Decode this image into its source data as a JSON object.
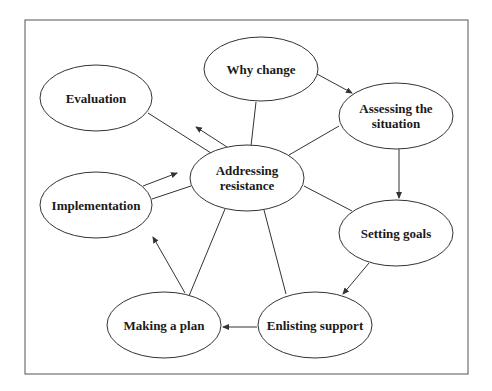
{
  "diagram": {
    "type": "cycle-with-hub",
    "frame": {
      "x": 25,
      "y": 20,
      "width": 443,
      "height": 354,
      "stroke": "#555555"
    },
    "hub": {
      "id": "hub",
      "lines": [
        "Addressing",
        "resistance"
      ],
      "cx": 247,
      "cy": 178,
      "rx": 57,
      "ry": 33
    },
    "nodes": [
      {
        "id": "why",
        "lines": [
          "Why change"
        ],
        "cx": 261,
        "cy": 69,
        "rx": 57,
        "ry": 32
      },
      {
        "id": "assess",
        "lines": [
          "Assessing the",
          "situation"
        ],
        "cx": 396,
        "cy": 116,
        "rx": 57,
        "ry": 33
      },
      {
        "id": "goals",
        "lines": [
          "Setting goals"
        ],
        "cx": 396,
        "cy": 233,
        "rx": 57,
        "ry": 33
      },
      {
        "id": "enlist",
        "lines": [
          "Enlisting support"
        ],
        "cx": 315,
        "cy": 325,
        "rx": 57,
        "ry": 33
      },
      {
        "id": "plan",
        "lines": [
          "Making a plan"
        ],
        "cx": 164,
        "cy": 325,
        "rx": 57,
        "ry": 33
      },
      {
        "id": "impl",
        "lines": [
          "Implementation"
        ],
        "cx": 96,
        "cy": 205,
        "rx": 56,
        "ry": 33
      },
      {
        "id": "eval",
        "lines": [
          "Evaluation"
        ],
        "cx": 96,
        "cy": 98,
        "rx": 56,
        "ry": 33
      }
    ],
    "cycle_arrows": [
      {
        "from": "why",
        "to": "assess",
        "x1": 317,
        "y1": 74,
        "x2": 352,
        "y2": 93
      },
      {
        "from": "assess",
        "to": "goals",
        "x1": 399,
        "y1": 149,
        "x2": 399,
        "y2": 198
      },
      {
        "from": "goals",
        "to": "enlist",
        "x1": 369,
        "y1": 263,
        "x2": 343,
        "y2": 294
      },
      {
        "from": "enlist",
        "to": "plan",
        "x1": 257,
        "y1": 327,
        "x2": 223,
        "y2": 327
      },
      {
        "from": "plan",
        "to": "impl",
        "x1": 185,
        "y1": 293,
        "x2": 153,
        "y2": 237
      },
      {
        "from": "impl",
        "to": "hub",
        "x1": 143,
        "y1": 186,
        "x2": 177,
        "y2": 173
      },
      {
        "from": "hub",
        "to": "eval",
        "x1": 227,
        "y1": 147,
        "x2": 196,
        "y2": 127
      }
    ],
    "spokes": [
      {
        "from": "hub",
        "to": "why",
        "x1": 251,
        "y1": 146,
        "x2": 256,
        "y2": 102
      },
      {
        "from": "hub",
        "to": "assess",
        "x1": 289,
        "y1": 155,
        "x2": 339,
        "y2": 126
      },
      {
        "from": "hub",
        "to": "goals",
        "x1": 304,
        "y1": 186,
        "x2": 352,
        "y2": 211
      },
      {
        "from": "hub",
        "to": "enlist",
        "x1": 264,
        "y1": 210,
        "x2": 286,
        "y2": 294
      },
      {
        "from": "hub",
        "to": "plan",
        "x1": 225,
        "y1": 209,
        "x2": 189,
        "y2": 296
      },
      {
        "from": "hub",
        "to": "impl",
        "x1": 191,
        "y1": 186,
        "x2": 152,
        "y2": 199
      },
      {
        "from": "hub",
        "to": "eval",
        "x1": 211,
        "y1": 153,
        "x2": 148,
        "y2": 113
      }
    ]
  }
}
